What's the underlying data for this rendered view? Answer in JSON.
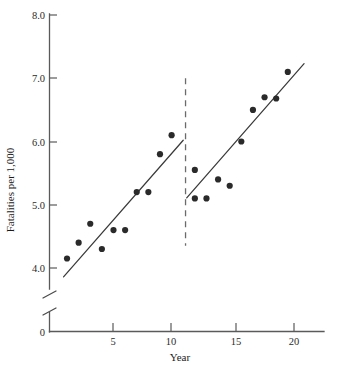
{
  "chart_data": {
    "type": "scatter",
    "title": "",
    "xlabel": "Year",
    "ylabel": "Fatalities per 1,000",
    "xlim": [
      0,
      22
    ],
    "ylim": [
      3.8,
      8.0
    ],
    "grid": false,
    "legend": "none",
    "y_axis_break": true,
    "y_axis_break_note": "axis broken between 0 and 4.0",
    "xticks": [
      5,
      10,
      15,
      20
    ],
    "xtick_labels": [
      "5",
      "10",
      "15",
      "20"
    ],
    "origin_label": "0",
    "yticks": [
      4.0,
      5.0,
      6.0,
      7.0,
      8.0
    ],
    "ytick_labels": [
      "4.0",
      "5.0",
      "6.0",
      "7.0",
      "8.0"
    ],
    "x": [
      1,
      2,
      3,
      4,
      5,
      6,
      7,
      8,
      9,
      10,
      12,
      12,
      13,
      14,
      15,
      16,
      17,
      18,
      19,
      20
    ],
    "y": [
      4.15,
      4.4,
      4.7,
      4.3,
      4.6,
      4.6,
      5.2,
      5.2,
      5.8,
      6.1,
      5.55,
      5.1,
      5.1,
      5.4,
      5.3,
      6.0,
      6.5,
      6.7,
      6.68,
      7.1
    ],
    "points": [
      {
        "x": 1,
        "y": 4.15
      },
      {
        "x": 2,
        "y": 4.4
      },
      {
        "x": 3,
        "y": 4.7
      },
      {
        "x": 4,
        "y": 4.3
      },
      {
        "x": 5,
        "y": 4.6
      },
      {
        "x": 6,
        "y": 4.6
      },
      {
        "x": 7,
        "y": 5.2
      },
      {
        "x": 8,
        "y": 5.2
      },
      {
        "x": 9,
        "y": 5.8
      },
      {
        "x": 10,
        "y": 6.1
      },
      {
        "x": 12,
        "y": 5.55
      },
      {
        "x": 12,
        "y": 5.1
      },
      {
        "x": 13,
        "y": 5.1
      },
      {
        "x": 14,
        "y": 5.4
      },
      {
        "x": 15,
        "y": 5.3
      },
      {
        "x": 16,
        "y": 6.0
      },
      {
        "x": 17,
        "y": 6.5
      },
      {
        "x": 18,
        "y": 6.7
      },
      {
        "x": 19,
        "y": 6.68
      },
      {
        "x": 20,
        "y": 7.1
      }
    ],
    "series": [
      {
        "name": "Segment 1 fit",
        "type": "line",
        "x": [
          0.7,
          11.0
        ],
        "y": [
          3.86,
          6.02
        ]
      },
      {
        "name": "Segment 2 fit",
        "type": "line",
        "x": [
          11.3,
          21.4
        ],
        "y": [
          5.11,
          7.23
        ]
      }
    ],
    "annotations": [
      {
        "name": "intervention-line",
        "type": "vline",
        "x": 11.2,
        "y_from": 4.35,
        "y_to": 7.0,
        "style": "dashed"
      }
    ]
  }
}
